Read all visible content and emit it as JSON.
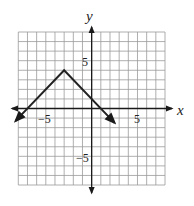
{
  "chart_data": {
    "type": "line",
    "title": "",
    "xlabel": "x",
    "ylabel": "y",
    "xlim": [
      -8,
      8
    ],
    "ylim": [
      -8,
      8
    ],
    "grid": true,
    "grid_step": 1,
    "tick_labels": {
      "x": [
        {
          "value": -5,
          "label": "−5"
        },
        {
          "value": 5,
          "label": "5"
        }
      ],
      "y": [
        {
          "value": 5,
          "label": "5"
        },
        {
          "value": -5,
          "label": "−5"
        }
      ]
    },
    "series": [
      {
        "name": "piecewise-linear",
        "points": [
          [
            -8.3,
            -1.3
          ],
          [
            -3,
            4
          ],
          [
            2.5,
            -1.5
          ]
        ],
        "arrows_at_ends": true,
        "color": "#222222"
      }
    ],
    "annotations": []
  },
  "labels": {
    "x_axis": "x",
    "y_axis": "y",
    "x_tick_neg5": "−5",
    "x_tick_5": "5",
    "y_tick_5": "5",
    "y_tick_neg5": "−5"
  },
  "colors": {
    "grid": "#9a9a9a",
    "axis": "#1a1a1a",
    "line": "#222222"
  }
}
